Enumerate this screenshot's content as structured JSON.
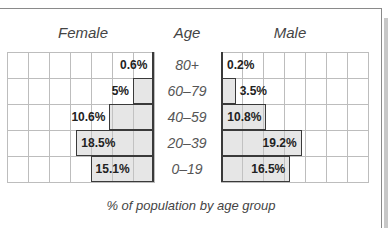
{
  "chart_data": {
    "type": "bar",
    "subtype": "population-pyramid",
    "title": "",
    "caption": "% of population by age group",
    "headers": {
      "left": "Female",
      "center": "Age",
      "right": "Male"
    },
    "categories": [
      "80+",
      "60–79",
      "40–59",
      "20–39",
      "0–19"
    ],
    "series": [
      {
        "name": "Female",
        "values": [
          0.6,
          5,
          10.6,
          18.5,
          15.1
        ],
        "labels": [
          "0.6%",
          "5%",
          "10.6%",
          "18.5%",
          "15.1%"
        ]
      },
      {
        "name": "Male",
        "values": [
          0.2,
          3.5,
          10.8,
          19.2,
          16.5
        ],
        "labels": [
          "0.2%",
          "3.5%",
          "10.8%",
          "19.2%",
          "16.5%"
        ]
      }
    ],
    "xlim": [
      0,
      35
    ],
    "grid_step": 5,
    "grid": true,
    "legend": "none",
    "colors": {
      "bar_fill": "#e2e2e2",
      "bar_border": "#3a3a3a",
      "grid": "#bdbdbd"
    }
  }
}
